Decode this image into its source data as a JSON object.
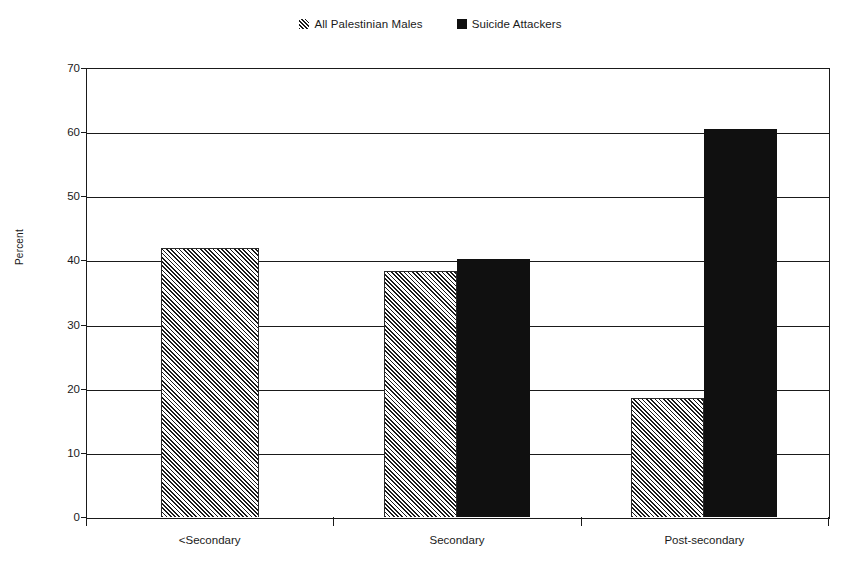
{
  "chart_data": {
    "type": "bar",
    "title": "",
    "xlabel": "",
    "ylabel": "Percent",
    "ylim": [
      0,
      70
    ],
    "yticks": [
      0,
      10,
      20,
      30,
      40,
      50,
      60,
      70
    ],
    "grid": true,
    "legend_position": "top-center",
    "categories": [
      "<Secondary",
      "Secondary",
      "Post-secondary"
    ],
    "series": [
      {
        "name": "All Palestinian Males",
        "style": "hatched",
        "values": [
          42,
          38.4,
          18.6
        ]
      },
      {
        "name": "Suicide Attackers",
        "style": "solid-black",
        "values": [
          0,
          40.3,
          60.5
        ]
      }
    ]
  },
  "legend": {
    "items": [
      {
        "label": "All Palestinian Males",
        "swatch": "hatched-square-icon"
      },
      {
        "label": "Suicide Attackers",
        "swatch": "black-square-icon"
      }
    ]
  },
  "axes": {
    "y": {
      "title": "Percent",
      "ticks": [
        "0",
        "10",
        "20",
        "30",
        "40",
        "50",
        "60",
        "70"
      ]
    },
    "x": {
      "ticks": [
        "<Secondary",
        "Secondary",
        "Post-secondary"
      ]
    }
  },
  "colors": {
    "ink": "#1a1a1a",
    "bar_solid": "#101010",
    "background": "#ffffff"
  }
}
